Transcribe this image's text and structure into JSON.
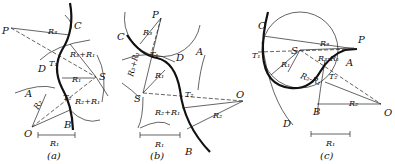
{
  "figure": {
    "panels": [
      {
        "id": "a",
        "caption": "(a)",
        "labels": {
          "P": "P",
          "C": "C",
          "D": "D",
          "A": "A",
          "B": "B",
          "O": "O",
          "S": "S",
          "T1": "T₁",
          "T2": "T₂",
          "R1": "R₁",
          "R2": "R₂",
          "R3": "R₃",
          "R3pR1": "R₃+R₁",
          "R2pR1": "R₂+R₁"
        },
        "scale_label": "R₁"
      },
      {
        "id": "b",
        "caption": "(b)",
        "labels": {
          "P": "P",
          "C": "C",
          "D": "D",
          "A": "A",
          "B": "B",
          "O": "O",
          "S": "S",
          "T1": "T₁",
          "T2": "T₂",
          "R1": "R₁",
          "R2": "R₂",
          "R3": "R₃",
          "R3pR1": "R₃+R₁",
          "R2pR1": "R₂+R₁"
        },
        "scale_label": "R₁"
      },
      {
        "id": "c",
        "caption": "(c)",
        "labels": {
          "P": "P",
          "C": "C",
          "D": "D",
          "A": "A",
          "B": "B",
          "O": "O",
          "S": "S",
          "T1": "T₁",
          "T2": "T₂",
          "R1": "R₁",
          "R2": "R₂",
          "R3": "R₃",
          "R3mR1": "R₃-R₁",
          "R2mR1": "R₂-R₁"
        },
        "scale_label": "R₁"
      }
    ]
  }
}
